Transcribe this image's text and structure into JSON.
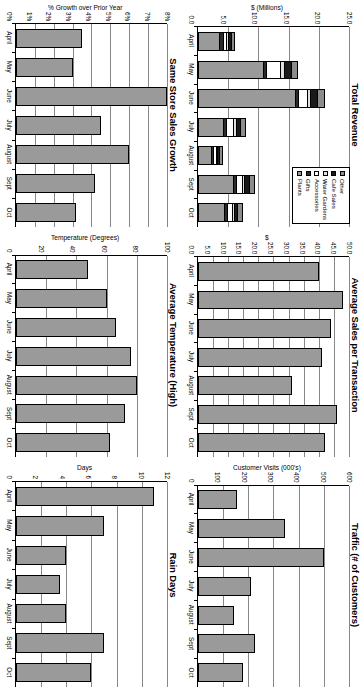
{
  "page": {
    "rotation_deg": 90,
    "background": "#ffffff",
    "bar_fill": "#9a9a9a",
    "bar_outline": "#000000",
    "gridline_color": "#888888"
  },
  "charts": [
    {
      "id": "total-revenue",
      "title": "Total Revenue",
      "ylabel": "$ (Millions)",
      "yticks": [
        "25.0",
        "20.0",
        "15.0",
        "10.0",
        "5.0",
        "0.0"
      ],
      "legend": {
        "position": "top-right",
        "items": [
          {
            "label": "Other",
            "color": "#8c8c8c"
          },
          {
            "label": "Cafe Sales",
            "color": "#1a1a1a"
          },
          {
            "label": "Water Gardens",
            "color": "#e0e0e0"
          },
          {
            "label": "Accessories",
            "color": "#ffffff"
          },
          {
            "label": "Gifts",
            "color": "#2b2b2b"
          },
          {
            "label": "Plants",
            "color": "#9a9a9a"
          }
        ]
      },
      "chart_data": {
        "type": "bar",
        "subtype": "stacked",
        "title": "Total Revenue",
        "xlabel": "",
        "ylabel": "$ (Millions)",
        "ylim": [
          0,
          25
        ],
        "yticks": [
          0,
          5,
          10,
          15,
          20,
          25
        ],
        "grid": true,
        "categories": [
          "April",
          "May",
          "June",
          "July",
          "August",
          "Sept",
          "Oct"
        ],
        "series": [
          {
            "name": "Plants",
            "values": [
              3.6,
              11.0,
              16.2,
              4.3,
              2.3,
              6.0,
              4.4
            ]
          },
          {
            "name": "Gifts",
            "values": [
              0.7,
              0.5,
              0.6,
              0.5,
              0.3,
              0.5,
              0.6
            ]
          },
          {
            "name": "Accessories",
            "values": [
              0.5,
              2.3,
              1.5,
              1.1,
              0.5,
              0.9,
              0.8
            ]
          },
          {
            "name": "Water Gardens",
            "values": [
              0.3,
              0.6,
              0.5,
              0.5,
              0.2,
              0.4,
              0.3
            ]
          },
          {
            "name": "Cafe Sales",
            "values": [
              0.5,
              1.2,
              1.0,
              0.8,
              0.4,
              0.9,
              0.6
            ]
          },
          {
            "name": "Other",
            "values": [
              0.5,
              0.9,
              1.2,
              0.8,
              0.4,
              0.8,
              0.8
            ]
          }
        ],
        "totals": [
          6.1,
          16.5,
          21.0,
          8.0,
          4.1,
          9.5,
          7.5
        ]
      }
    },
    {
      "id": "avg-sales-per-transaction",
      "title": "Average Sales per Transaction",
      "ylabel": "$",
      "yticks": [
        "50.0",
        "45.0",
        "40.0",
        "35.0",
        "30.0",
        "25.0",
        "20.0",
        "15.0",
        "10.0",
        "5.0",
        "0.0"
      ],
      "chart_data": {
        "type": "bar",
        "title": "Average Sales per Transaction",
        "xlabel": "",
        "ylabel": "$",
        "ylim": [
          0,
          50
        ],
        "yticks": [
          0,
          5,
          10,
          15,
          20,
          25,
          30,
          35,
          40,
          45,
          50
        ],
        "grid": true,
        "categories": [
          "April",
          "May",
          "June",
          "July",
          "August",
          "Sept",
          "Oct"
        ],
        "values": [
          40.0,
          48.0,
          44.0,
          41.0,
          31.0,
          46.0,
          42.0
        ]
      }
    },
    {
      "id": "traffic",
      "title": "Traffic (# of Customers)",
      "ylabel": "Customer Visits (000's)",
      "yticks": [
        "600",
        "500",
        "400",
        "300",
        "200",
        "100",
        "0"
      ],
      "chart_data": {
        "type": "bar",
        "title": "Traffic (# of Customers)",
        "xlabel": "",
        "ylabel": "Customer Visits (000's)",
        "ylim": [
          0,
          600
        ],
        "yticks": [
          0,
          100,
          200,
          300,
          400,
          500,
          600
        ],
        "grid": true,
        "categories": [
          "April",
          "May",
          "June",
          "July",
          "August",
          "Sept",
          "Oct"
        ],
        "values": [
          155,
          345,
          500,
          210,
          145,
          225,
          180
        ]
      }
    },
    {
      "id": "same-store-sales-growth",
      "title": "Same Store Sales Growth",
      "ylabel": "% Growth over Prior Year",
      "yticks": [
        "8%",
        "7%",
        "6%",
        "5%",
        "4%",
        "3%",
        "2%",
        "1%",
        "0%"
      ],
      "chart_data": {
        "type": "bar",
        "title": "Same Store Sales Growth",
        "xlabel": "",
        "ylabel": "% Growth over Prior Year",
        "ylim": [
          0,
          8
        ],
        "yticks": [
          0,
          1,
          2,
          3,
          4,
          5,
          6,
          7,
          8
        ],
        "units": "percent",
        "grid": true,
        "categories": [
          "April",
          "May",
          "June",
          "July",
          "August",
          "Sept",
          "Oct"
        ],
        "values": [
          3.5,
          3.0,
          8.0,
          4.5,
          6.0,
          4.2,
          3.2
        ]
      }
    },
    {
      "id": "average-temperature",
      "title": "Average Temperature (High)",
      "ylabel": "Temperature (Degrees)",
      "yticks": [
        "100",
        "80",
        "60",
        "40",
        "20",
        "0"
      ],
      "chart_data": {
        "type": "bar",
        "title": "Average Temperature (High)",
        "xlabel": "",
        "ylabel": "Temperature (Degrees)",
        "ylim": [
          0,
          100
        ],
        "yticks": [
          0,
          20,
          40,
          60,
          80,
          100
        ],
        "grid": true,
        "categories": [
          "April",
          "May",
          "June",
          "July",
          "August",
          "Sept",
          "Oct"
        ],
        "values": [
          48,
          60,
          66,
          76,
          80,
          72,
          62
        ]
      }
    },
    {
      "id": "rain-days",
      "title": "Rain Days",
      "ylabel": "Days",
      "yticks": [
        "12",
        "10",
        "8",
        "6",
        "4",
        "2",
        "0"
      ],
      "chart_data": {
        "type": "bar",
        "title": "Rain Days",
        "xlabel": "",
        "ylabel": "Days",
        "ylim": [
          0,
          12
        ],
        "yticks": [
          0,
          2,
          4,
          6,
          8,
          10,
          12
        ],
        "grid": true,
        "categories": [
          "April",
          "May",
          "June",
          "July",
          "August",
          "Sept",
          "Oct"
        ],
        "values": [
          11.0,
          7.0,
          4.0,
          3.5,
          4.0,
          7.0,
          6.0
        ]
      }
    }
  ]
}
